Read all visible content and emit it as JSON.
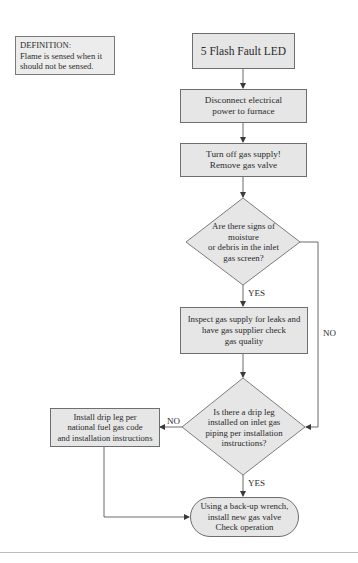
{
  "definition": {
    "title": "DEFINITION:",
    "text": "Flame is sensed when it\nshould not be sensed."
  },
  "flowchart": {
    "start": {
      "id": "start",
      "shape": "rectangle",
      "text": "5 Flash Fault LED"
    },
    "steps": [
      {
        "id": "disconnect",
        "shape": "rectangle",
        "text": "Disconnect electrical\npower to furnace"
      },
      {
        "id": "turn-off-gas",
        "shape": "rectangle",
        "text": "Turn off gas supply!\nRemove gas valve"
      },
      {
        "id": "inspect-gas",
        "shape": "rectangle",
        "text": "Inspect gas supply for leaks and\nhave gas supplier check\ngas quality"
      },
      {
        "id": "install-drip-leg",
        "shape": "rectangle",
        "text": "Install drip leg per\nnational fuel gas code\nand installation instructions"
      }
    ],
    "decisions": [
      {
        "id": "moisture-check",
        "shape": "diamond",
        "text": "Are there signs of\nmoisture\nor debris in the inlet\ngas screen?",
        "yes_label": "YES",
        "no_label": "NO"
      },
      {
        "id": "drip-leg-check",
        "shape": "diamond",
        "text": "Is there a drip leg\ninstalled on inlet gas\npiping per installation\ninstructions?",
        "yes_label": "YES",
        "no_label": "NO"
      }
    ],
    "end": {
      "id": "end",
      "shape": "terminal",
      "text": "Using a back-up wrench,\ninstall new gas valve\nCheck operation"
    },
    "edges": [
      {
        "from": "start",
        "to": "disconnect",
        "label": ""
      },
      {
        "from": "disconnect",
        "to": "turn-off-gas",
        "label": ""
      },
      {
        "from": "turn-off-gas",
        "to": "moisture-check",
        "label": ""
      },
      {
        "from": "moisture-check",
        "to": "inspect-gas",
        "label": "YES"
      },
      {
        "from": "moisture-check",
        "to": "drip-leg-check",
        "label": "NO"
      },
      {
        "from": "inspect-gas",
        "to": "drip-leg-check",
        "label": ""
      },
      {
        "from": "drip-leg-check",
        "to": "install-drip-leg",
        "label": "NO"
      },
      {
        "from": "drip-leg-check",
        "to": "end",
        "label": "YES"
      },
      {
        "from": "install-drip-leg",
        "to": "end",
        "label": ""
      }
    ]
  },
  "colors": {
    "node_fill": "#e6e6e6",
    "node_border": "#6e6e6e",
    "line": "#5a5a5a",
    "text": "#2a2a2a"
  }
}
